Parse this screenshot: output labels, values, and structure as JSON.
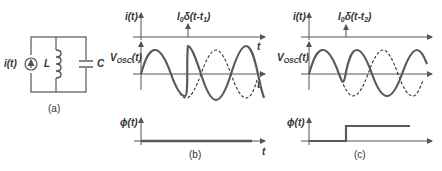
{
  "figure": {
    "panel_a": {
      "caption": "(a)",
      "source_label": "i(t)",
      "inductor_label": "L",
      "capacitor_label": "C"
    },
    "panel_b": {
      "caption": "(b)",
      "i_axis_label": "i(t)",
      "impulse_label_main": "I",
      "impulse_label_sub": "0",
      "impulse_label_rest": "δ(t-t",
      "impulse_label_tsub": "1",
      "impulse_label_close": ")",
      "v_axis_label_main": "V",
      "v_axis_label_sub": "OSC",
      "v_axis_label_rest": "(t)",
      "phi_axis_label": "ϕ(t)",
      "t_label": "t"
    },
    "panel_c": {
      "caption": "(c)",
      "i_axis_label": "i(t)",
      "impulse_label_main": "I",
      "impulse_label_sub": "0",
      "impulse_label_rest": "δ(t-t",
      "impulse_label_tsub": "2",
      "impulse_label_close": ")",
      "v_axis_label_main": "V",
      "v_axis_label_sub": "OSC",
      "v_axis_label_rest": "(t)",
      "phi_axis_label": "ϕ(t)",
      "t_label": "t"
    },
    "colors": {
      "stroke": "#555555",
      "wave": "#5a5a5a",
      "dashed": "#333333"
    }
  }
}
